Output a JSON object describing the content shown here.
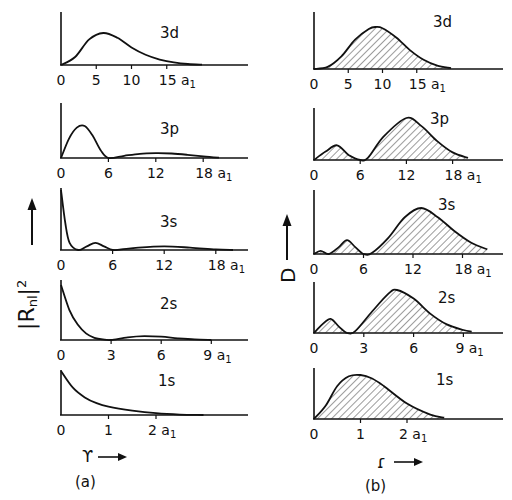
{
  "figure": {
    "panel_a": {
      "caption": "(a)",
      "ylabel": "|Rnl|²",
      "xlabel": "r",
      "unit": "a1"
    },
    "panel_b": {
      "caption": "(b)",
      "ylabel": "D",
      "xlabel": "r",
      "unit": "a1"
    }
  },
  "chart_data": [
    {
      "type": "line",
      "title": "(a) Radial probability |Rnl|² vs r",
      "ylabel": "|Rnl|²",
      "xlabel": "r (units of a1)",
      "grid": false,
      "subplots": [
        {
          "orbital": "3d",
          "xticks": [
            0,
            5,
            10,
            15
          ],
          "xtick_labels": [
            "0",
            "5",
            "10",
            "15 a1"
          ],
          "x": [
            0,
            2,
            4,
            6,
            8,
            10,
            12,
            14,
            16,
            18,
            20
          ],
          "y": [
            0,
            0.25,
            0.8,
            1.0,
            0.85,
            0.55,
            0.32,
            0.17,
            0.08,
            0.03,
            0.01
          ]
        },
        {
          "orbital": "3p",
          "xticks": [
            0,
            6,
            12,
            18
          ],
          "xtick_labels": [
            "0",
            "6",
            "12",
            "18 a1"
          ],
          "x": [
            0,
            1,
            2,
            3,
            4,
            5,
            6,
            8,
            10,
            12,
            14,
            16,
            18,
            20
          ],
          "y": [
            0,
            0.6,
            0.95,
            1.0,
            0.7,
            0.25,
            0,
            0.07,
            0.13,
            0.15,
            0.14,
            0.1,
            0.05,
            0.01
          ]
        },
        {
          "orbital": "3s",
          "xticks": [
            0,
            6,
            12,
            18
          ],
          "xtick_labels": [
            "0",
            "6",
            "12",
            "18 a1"
          ],
          "x": [
            0,
            0.5,
            1,
            2,
            3,
            4,
            5,
            6,
            7,
            9,
            12,
            15,
            18,
            20
          ],
          "y": [
            1.0,
            0.45,
            0.12,
            0,
            0.06,
            0.12,
            0.06,
            0,
            0.01,
            0.04,
            0.06,
            0.04,
            0.01,
            0
          ]
        },
        {
          "orbital": "2s",
          "xticks": [
            0,
            3,
            6,
            9
          ],
          "xtick_labels": [
            "0",
            "3",
            "6",
            "9 a1"
          ],
          "x": [
            0,
            0.5,
            1,
            1.5,
            2,
            2.5,
            3,
            4,
            5,
            6,
            7,
            8,
            9
          ],
          "y": [
            1.0,
            0.55,
            0.28,
            0.12,
            0.04,
            0.01,
            0,
            0.05,
            0.07,
            0.06,
            0.03,
            0.01,
            0
          ]
        },
        {
          "orbital": "1s",
          "xticks": [
            0,
            1,
            2
          ],
          "xtick_labels": [
            "0",
            "1",
            "2 a1"
          ],
          "x": [
            0,
            0.25,
            0.5,
            0.75,
            1,
            1.5,
            2,
            2.5,
            3
          ],
          "y": [
            1.0,
            0.62,
            0.4,
            0.27,
            0.19,
            0.1,
            0.04,
            0.01,
            0
          ]
        }
      ]
    },
    {
      "type": "area",
      "title": "(b) Radial distribution function D vs r (hatched)",
      "ylabel": "D",
      "xlabel": "r (units of a1)",
      "grid": false,
      "subplots": [
        {
          "orbital": "3d",
          "xticks": [
            0,
            5,
            10,
            15
          ],
          "xtick_labels": [
            "0",
            "5",
            "10",
            "15a1"
          ],
          "x": [
            0,
            2,
            4,
            6,
            8,
            9,
            10,
            12,
            14,
            16,
            18,
            20
          ],
          "y": [
            0,
            0.05,
            0.3,
            0.7,
            0.95,
            1.0,
            0.97,
            0.75,
            0.45,
            0.22,
            0.08,
            0.02
          ]
        },
        {
          "orbital": "3p",
          "xticks": [
            0,
            6,
            12,
            18
          ],
          "xtick_labels": [
            "0",
            "6",
            "12",
            "18 a1"
          ],
          "x": [
            0,
            1.5,
            3,
            4.5,
            6,
            7,
            9,
            12,
            14,
            16,
            18,
            20
          ],
          "y": [
            0,
            0.2,
            0.35,
            0.12,
            0,
            0.05,
            0.55,
            1.0,
            0.8,
            0.45,
            0.18,
            0.05
          ]
        },
        {
          "orbital": "3s",
          "xticks": [
            0,
            6,
            12,
            18
          ],
          "xtick_labels": [
            "0",
            "6",
            "12",
            "18 a1"
          ],
          "x": [
            0,
            0.8,
            1.8,
            3,
            4,
            5,
            6,
            7,
            9,
            11,
            13,
            15,
            17,
            19,
            21
          ],
          "y": [
            0,
            0.07,
            0,
            0.15,
            0.3,
            0.15,
            0,
            0.02,
            0.35,
            0.8,
            1.0,
            0.8,
            0.5,
            0.25,
            0.1
          ]
        },
        {
          "orbital": "2s",
          "xticks": [
            0,
            3,
            6,
            9
          ],
          "xtick_labels": [
            "0",
            "3",
            "6",
            "9 a1"
          ],
          "x": [
            0,
            0.5,
            1,
            1.5,
            2,
            2.5,
            3.5,
            4.5,
            5,
            6,
            7,
            8,
            9,
            9.5
          ],
          "y": [
            0,
            0.2,
            0.33,
            0.15,
            0,
            0.05,
            0.5,
            0.92,
            1.0,
            0.8,
            0.45,
            0.2,
            0.07,
            0.03
          ]
        },
        {
          "orbital": "1s",
          "xticks": [
            0,
            1,
            2
          ],
          "xtick_labels": [
            "0",
            "1",
            "2 a1"
          ],
          "x": [
            0,
            0.25,
            0.5,
            0.75,
            1,
            1.25,
            1.5,
            2,
            2.5,
            2.8
          ],
          "y": [
            0,
            0.3,
            0.75,
            0.97,
            1.0,
            0.92,
            0.75,
            0.35,
            0.1,
            0.03
          ]
        }
      ]
    }
  ]
}
